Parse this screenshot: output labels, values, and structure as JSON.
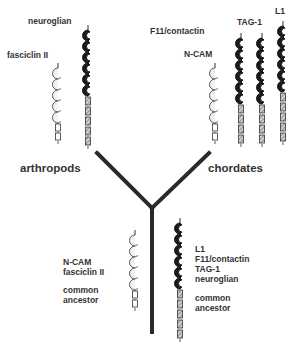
{
  "diagram": {
    "type": "evolutionary-tree",
    "branches": {
      "left": "arthropods",
      "right": "chordates"
    },
    "colors": {
      "ink": "#2a2a2a",
      "open_domain": "#ffffff",
      "filled_domain": "#1a1a1a",
      "hatched": "#aaaaaa"
    },
    "molecules": {
      "arthropods": [
        {
          "name": "fasciclin II",
          "ig_domains": 5,
          "ig_style": "open",
          "fn3_domains": 2,
          "fn3_style": "plain"
        },
        {
          "name": "neuroglian",
          "ig_domains": 6,
          "ig_style": "filled",
          "fn3_domains": 5,
          "fn3_style": "hatched"
        }
      ],
      "chordates": [
        {
          "name": "N-CAM",
          "ig_domains": 5,
          "ig_style": "open",
          "fn3_domains": 2,
          "fn3_style": "plain"
        },
        {
          "name": "F11/contactin",
          "ig_domains": 6,
          "ig_style": "filled",
          "fn3_domains": 4,
          "fn3_style": "hatched"
        },
        {
          "name": "TAG-1",
          "ig_domains": 6,
          "ig_style": "filled",
          "fn3_domains": 4,
          "fn3_style": "hatched"
        },
        {
          "name": "L1",
          "ig_domains": 6,
          "ig_style": "filled",
          "fn3_domains": 5,
          "fn3_style": "hatched"
        }
      ],
      "ancestors": [
        {
          "lines": [
            "N-CAM",
            "fasciclin II",
            "",
            "common",
            "ancestor"
          ],
          "ig_domains": 5,
          "ig_style": "open",
          "fn3_domains": 2,
          "fn3_style": "plain"
        },
        {
          "lines": [
            "L1",
            "F11/contactin",
            "TAG-1",
            "neuroglian",
            "",
            "common",
            "ancestor"
          ],
          "ig_domains": 6,
          "ig_style": "filled",
          "fn3_domains": 5,
          "fn3_style": "hatched"
        }
      ]
    }
  }
}
